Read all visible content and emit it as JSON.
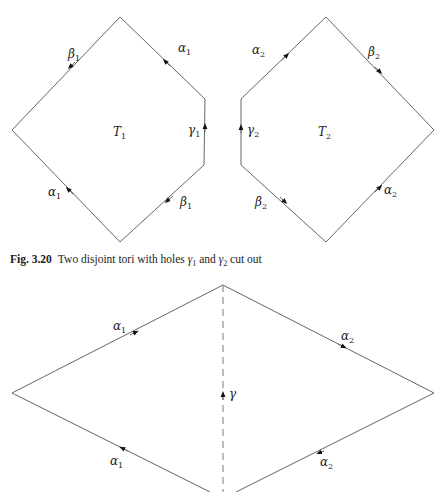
{
  "figure_top": {
    "torus_1": {
      "label": "T",
      "label_sub": "1",
      "edges": [
        {
          "name": "beta",
          "sub": "1"
        },
        {
          "name": "alpha",
          "sub": "1"
        },
        {
          "name": "gamma",
          "sub": "1"
        },
        {
          "name": "beta",
          "sub": "1"
        },
        {
          "name": "alpha",
          "sub": "1"
        }
      ]
    },
    "torus_2": {
      "label": "T",
      "label_sub": "2",
      "edges": [
        {
          "name": "alpha",
          "sub": "2"
        },
        {
          "name": "beta",
          "sub": "2"
        },
        {
          "name": "gamma",
          "sub": "2"
        },
        {
          "name": "beta",
          "sub": "2"
        },
        {
          "name": "alpha",
          "sub": "2"
        }
      ]
    }
  },
  "caption": {
    "fig_number": "Fig. 3.20",
    "text_before": "Two disjoint tori with holes ",
    "g1": "γ",
    "g1_sub": "1",
    "text_mid": " and ",
    "g2": "γ",
    "g2_sub": "2",
    "text_after": " cut out"
  },
  "figure_bottom": {
    "edges": [
      {
        "name": "alpha",
        "sub": "1"
      },
      {
        "name": "alpha",
        "sub": "2"
      },
      {
        "name": "alpha",
        "sub": "1"
      },
      {
        "name": "alpha",
        "sub": "2"
      }
    ],
    "middle": {
      "name": "gamma"
    }
  },
  "symbols": {
    "alpha": "α",
    "beta": "β",
    "gamma": "γ",
    "T": "T"
  },
  "colors": {
    "stroke": "#555555",
    "text": "#222222"
  }
}
